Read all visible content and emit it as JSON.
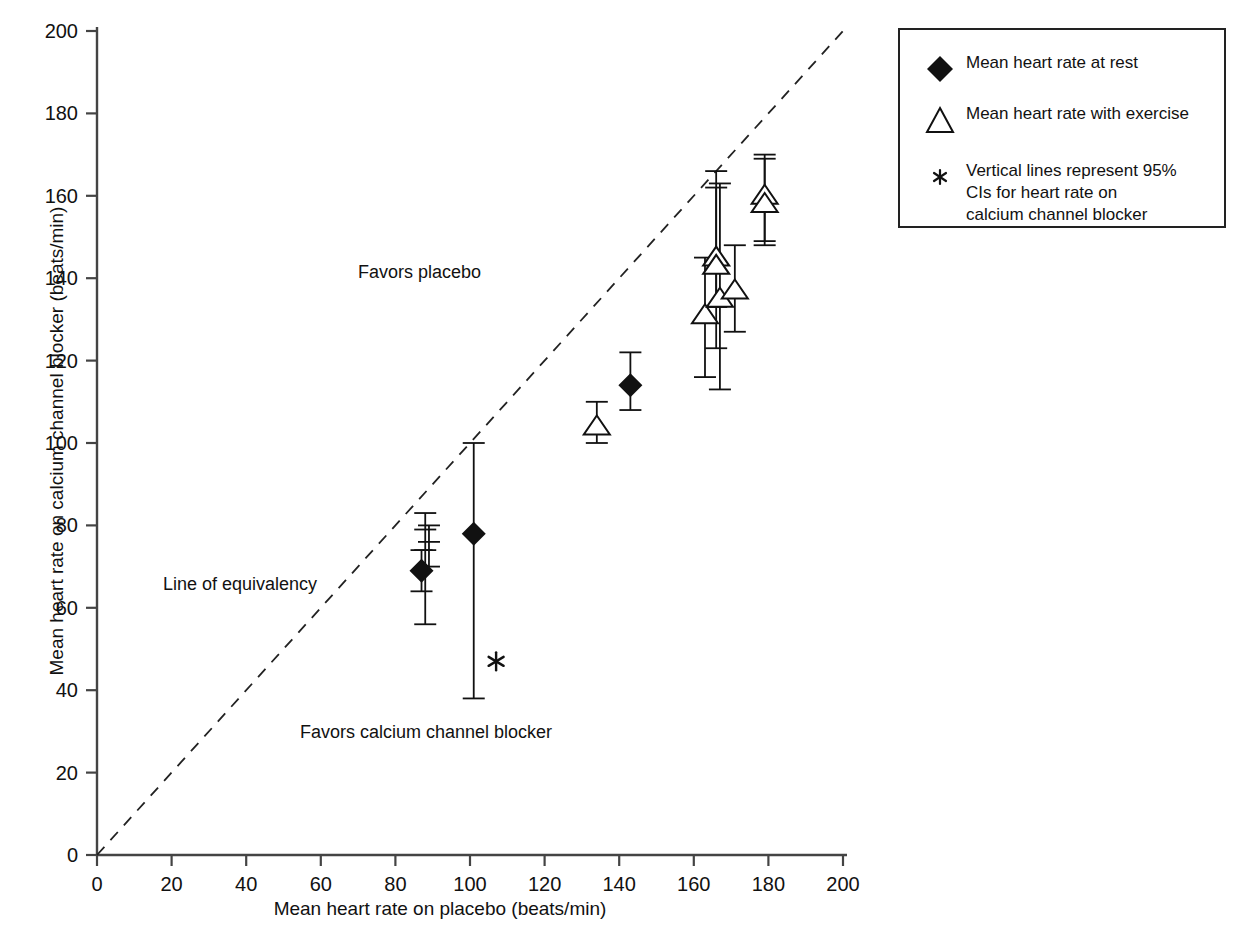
{
  "chart_data": {
    "type": "scatter",
    "title": "",
    "xlabel": "Mean heart rate on placebo (beats/min)",
    "ylabel": "Mean heart rate on calcium channel blocker (beats/min)",
    "xlim": [
      0,
      200
    ],
    "ylim": [
      0,
      200
    ],
    "xticks": [
      0,
      20,
      40,
      60,
      80,
      100,
      120,
      140,
      160,
      180,
      200
    ],
    "yticks": [
      0,
      20,
      40,
      60,
      80,
      100,
      120,
      140,
      160,
      180,
      200
    ],
    "grid": false,
    "legend_position": "top-right",
    "reference_line": {
      "name": "Line of equivalency",
      "style": "dashed",
      "from": [
        0,
        0
      ],
      "to": [
        200,
        200
      ]
    },
    "series": [
      {
        "name": "Mean heart rate at rest",
        "marker": "filled-diamond",
        "points": [
          {
            "x": 87,
            "y": 69,
            "ci_low": 64,
            "ci_high": 74
          },
          {
            "x": 101,
            "y": 78,
            "ci_low": 38,
            "ci_high": 100
          },
          {
            "x": 143,
            "y": 114,
            "ci_low": 108,
            "ci_high": 122
          }
        ]
      },
      {
        "name": "Mean heart rate with exercise",
        "marker": "open-triangle",
        "points": [
          {
            "x": 134,
            "y": 104,
            "ci_low": 100,
            "ci_high": 110
          },
          {
            "x": 163,
            "y": 131,
            "ci_low": 116,
            "ci_high": 145
          },
          {
            "x": 166,
            "y": 145,
            "ci_low": 133,
            "ci_high": 166
          },
          {
            "x": 166,
            "y": 143,
            "ci_low": 123,
            "ci_high": 162
          },
          {
            "x": 167,
            "y": 135,
            "ci_low": 113,
            "ci_high": 163
          },
          {
            "x": 171,
            "y": 137,
            "ci_low": 127,
            "ci_high": 148
          },
          {
            "x": 179,
            "y": 160,
            "ci_low": 148,
            "ci_high": 170
          },
          {
            "x": 179,
            "y": 158,
            "ci_low": 149,
            "ci_high": 169
          }
        ]
      }
    ],
    "extra_ci_bars": [
      {
        "x": 88,
        "y_low": 56,
        "y_high": 83,
        "ticks": [
          74,
          79
        ]
      },
      {
        "x": 89,
        "y_low": 70,
        "y_high": 80,
        "ticks": [
          76
        ]
      }
    ],
    "annotations": [
      {
        "name": "favors-placebo",
        "text": "Favors placebo",
        "x": 96,
        "y": 143
      },
      {
        "name": "line-of-equivalency",
        "text": "Line of equivalency",
        "x": 18,
        "y": 67
      },
      {
        "name": "favors-calcium-channel-blocker",
        "text": "Favors calcium channel blocker",
        "x": 55,
        "y": 30
      },
      {
        "name": "asterisk-marker",
        "text": "*",
        "x": 107,
        "y": 47
      }
    ]
  },
  "legend": {
    "items": [
      {
        "marker": "filled-diamond",
        "label": "Mean heart rate at rest"
      },
      {
        "marker": "open-triangle",
        "label": "Mean heart rate with exercise"
      },
      {
        "marker": "asterisk",
        "label": "Vertical lines represent 95%\nCIs for heart rate on\ncalcium channel blocker"
      }
    ]
  },
  "style": {
    "axis_color": "#444444",
    "marker_color": "#111111",
    "background": "#ffffff"
  }
}
